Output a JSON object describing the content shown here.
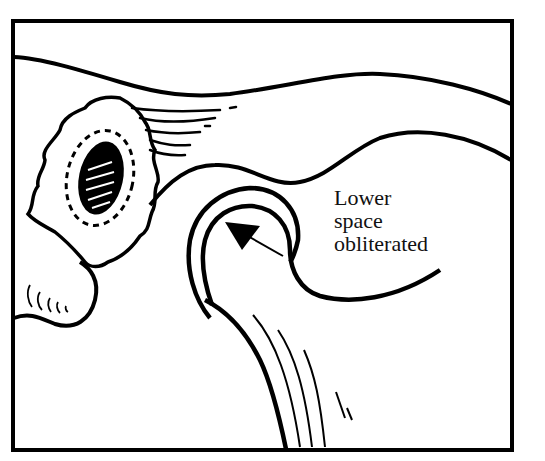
{
  "figure": {
    "type": "anatomical line drawing",
    "label_lines": [
      "Lower",
      "space",
      "obliterated"
    ],
    "colors": {
      "ink": "#000000",
      "paper": "#ffffff"
    }
  }
}
